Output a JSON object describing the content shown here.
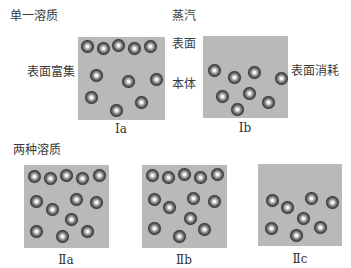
{
  "section_single": {
    "title": "单一溶质",
    "labels": {
      "vapor": "蒸汽",
      "surface": "表面",
      "bulk": "本体",
      "surface_enriched": "表面富集",
      "surface_depleted": "表面消耗"
    },
    "panels": [
      {
        "id": "Ia",
        "caption": "Ⅰa",
        "box": {
          "x": 78,
          "y": 37,
          "w": 87,
          "h": 83
        },
        "balls": [
          [
            81,
            40
          ],
          [
            97,
            42
          ],
          [
            112,
            39
          ],
          [
            128,
            42
          ],
          [
            144,
            40
          ],
          [
            90,
            69
          ],
          [
            122,
            75
          ],
          [
            150,
            73
          ],
          [
            85,
            91
          ],
          [
            110,
            104
          ],
          [
            135,
            96
          ]
        ]
      },
      {
        "id": "Ib",
        "caption": "Ⅰb",
        "box": {
          "x": 203,
          "y": 36,
          "w": 85,
          "h": 82
        },
        "balls": [
          [
            208,
            64
          ],
          [
            228,
            71
          ],
          [
            248,
            66
          ],
          [
            275,
            72
          ],
          [
            216,
            90
          ],
          [
            243,
            87
          ],
          [
            231,
            103
          ],
          [
            262,
            96
          ]
        ]
      }
    ]
  },
  "section_two": {
    "title": "两种溶质",
    "panels": [
      {
        "id": "IIa",
        "caption": "Ⅱa",
        "box": {
          "x": 24,
          "y": 165,
          "w": 85,
          "h": 83
        },
        "balls": [
          [
            28,
            170
          ],
          [
            44,
            172
          ],
          [
            60,
            169
          ],
          [
            76,
            172
          ],
          [
            93,
            169
          ],
          [
            30,
            195
          ],
          [
            46,
            203
          ],
          [
            70,
            193
          ],
          [
            90,
            196
          ],
          [
            65,
            213
          ],
          [
            30,
            225
          ],
          [
            56,
            230
          ],
          [
            81,
            225
          ]
        ]
      },
      {
        "id": "IIb",
        "caption": "Ⅱb",
        "box": {
          "x": 142,
          "y": 165,
          "w": 85,
          "h": 83
        },
        "balls": [
          [
            146,
            169
          ],
          [
            162,
            171
          ],
          [
            178,
            168
          ],
          [
            194,
            171
          ],
          [
            211,
            168
          ],
          [
            148,
            193
          ],
          [
            163,
            201
          ],
          [
            187,
            192
          ],
          [
            208,
            195
          ],
          [
            184,
            212
          ],
          [
            148,
            222
          ],
          [
            173,
            230
          ],
          [
            198,
            223
          ]
        ]
      },
      {
        "id": "IIc",
        "caption": "Ⅱc",
        "box": {
          "x": 258,
          "y": 164,
          "w": 84,
          "h": 82
        },
        "balls": [
          [
            266,
            194
          ],
          [
            281,
            201
          ],
          [
            305,
            192
          ],
          [
            326,
            196
          ],
          [
            297,
            212
          ],
          [
            265,
            222
          ],
          [
            290,
            229
          ],
          [
            314,
            221
          ]
        ]
      }
    ]
  }
}
